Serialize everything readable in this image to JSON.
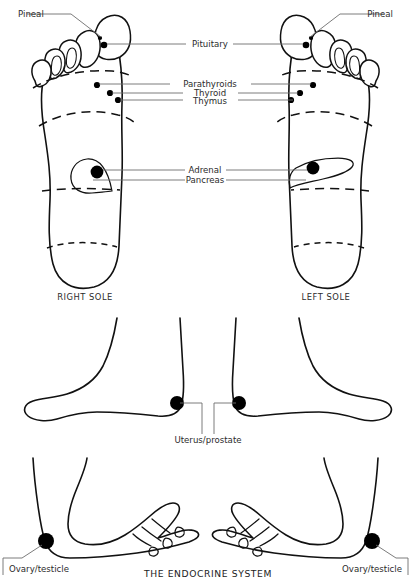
{
  "figure": {
    "title": "THE ENDOCRINE SYSTEM",
    "captions": {
      "right_sole": "RIGHT SOLE",
      "left_sole": "LEFT SOLE"
    }
  },
  "panels": [
    {
      "id": "soles",
      "name": "plantar-view",
      "labels": [
        {
          "key": "pineal_right",
          "text": "Pineal"
        },
        {
          "key": "pineal_left",
          "text": "Pineal"
        },
        {
          "key": "pituitary",
          "text": "Pituitary"
        },
        {
          "key": "parathyroids",
          "text": "Parathyroids"
        },
        {
          "key": "thyroid",
          "text": "Thyroid"
        },
        {
          "key": "thymus",
          "text": "Thymus"
        },
        {
          "key": "adrenal",
          "text": "Adrenal"
        },
        {
          "key": "pancreas",
          "text": "Pancreas"
        }
      ]
    },
    {
      "id": "medial",
      "name": "medial-view",
      "labels": [
        {
          "key": "uterus_prostate",
          "text": "Uterus/prostate"
        }
      ]
    },
    {
      "id": "lateral",
      "name": "lateral-view",
      "labels": [
        {
          "key": "ovary_testicle_left",
          "text": "Ovary/testicle"
        },
        {
          "key": "ovary_testicle_right",
          "text": "Ovary/testicle"
        }
      ]
    }
  ],
  "reflex_points": [
    {
      "name": "Pineal",
      "foot": "right sole",
      "x": 100,
      "y": 38
    },
    {
      "name": "Pituitary",
      "foot": "right sole",
      "x": 104,
      "y": 44
    },
    {
      "name": "Parathyroids",
      "foot": "right sole",
      "x": 97,
      "y": 85
    },
    {
      "name": "Thyroid",
      "foot": "right sole",
      "x": 110,
      "y": 93
    },
    {
      "name": "Thymus",
      "foot": "right sole",
      "x": 118,
      "y": 100
    },
    {
      "name": "Adrenal",
      "foot": "right sole",
      "x": 97,
      "y": 172
    },
    {
      "name": "Pineal",
      "foot": "left sole",
      "x": 311,
      "y": 38
    },
    {
      "name": "Pituitary",
      "foot": "left sole",
      "x": 306,
      "y": 44
    },
    {
      "name": "Parathyroids",
      "foot": "left sole",
      "x": 313,
      "y": 85
    },
    {
      "name": "Thyroid",
      "foot": "left sole",
      "x": 300,
      "y": 93
    },
    {
      "name": "Thymus",
      "foot": "left sole",
      "x": 291,
      "y": 100
    },
    {
      "name": "Adrenal",
      "foot": "left sole",
      "x": 313,
      "y": 168
    },
    {
      "name": "Uterus/prostate",
      "foot": "right medial",
      "x": 177,
      "y": 403
    },
    {
      "name": "Uterus/prostate",
      "foot": "left medial",
      "x": 239,
      "y": 403
    },
    {
      "name": "Ovary/testicle",
      "foot": "left lateral",
      "x": 46,
      "y": 541
    },
    {
      "name": "Ovary/testicle",
      "foot": "right lateral",
      "x": 372,
      "y": 541
    }
  ],
  "colors": {
    "ink": "#111111",
    "point": "#000000",
    "leader": "#6d6d6d",
    "text": "#2b2b2b",
    "background": "#ffffff"
  }
}
